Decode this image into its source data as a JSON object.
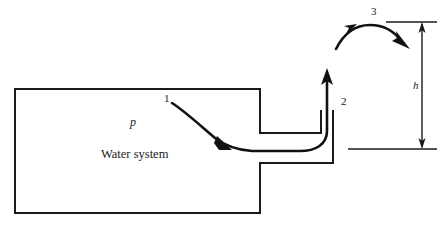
{
  "figure": {
    "kind": "engineering-schematic",
    "stroke_color": "#1a1a1a",
    "background_color": "#ffffff"
  },
  "labels": {
    "station_1": "1",
    "station_2": "2",
    "station_3": "3",
    "pressure": "p",
    "system": "Water system",
    "height": "h"
  },
  "parts": {
    "tank": "tank-body",
    "pipe": "discharge-pipe",
    "nozzle": "vertical-nozzle",
    "streamline": "flow-streamline",
    "jet": "free-jet-arc",
    "dimension": "height-dimension-h",
    "datum_upper": "upper-reference-line",
    "datum_lower": "lower-reference-line"
  },
  "geometry": {
    "tank_left_x": 15,
    "tank_top_y": 89,
    "tank_bottom_y": 213,
    "tank_right_x": 260,
    "pipe_top_y": 133,
    "pipe_bottom_y": 163,
    "pipe_right_x": 333,
    "nozzle_inner_x": 321,
    "nozzle_mouth_y": 111,
    "jet_peak_y": 26,
    "dim_line_x": 422,
    "dim_top_y": 22,
    "dim_bottom_y": 149
  }
}
